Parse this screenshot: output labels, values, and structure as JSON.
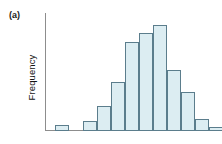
{
  "panel": {
    "label": "(a)"
  },
  "axes": {
    "ylabel": "Frequency",
    "xlabel": "",
    "axis_color": "#8d8d8d"
  },
  "style": {
    "bar_fill": "#dcedf2",
    "bar_border": "#5b7d8c",
    "background": "#ffffff",
    "text_color": "#141414"
  },
  "chart_data": {
    "type": "bar",
    "title": "",
    "subtitle": "",
    "annotations": [
      "(a)"
    ],
    "xlabel": "",
    "ylabel": "Frequency",
    "grid": false,
    "legend": null,
    "xtick_labels": [],
    "ytick_labels": [],
    "ylim": [
      0,
      100
    ],
    "note": "Unimodal, roughly symmetric (slightly right-skewed) histogram; axes unlabelled with no tick values. Values below are relative frequencies read off bar heights as a percentage of the tallest bar.",
    "categories": [
      "1",
      "2",
      "3",
      "4",
      "5",
      "6",
      "7",
      "8",
      "9",
      "10",
      "11",
      "12",
      "13",
      "14"
    ],
    "values": [
      6,
      0,
      9,
      24,
      46,
      84,
      92,
      100,
      58,
      37,
      11,
      4,
      0,
      0
    ],
    "bars": [
      {
        "index": 1,
        "x_left": 10,
        "width": 14,
        "value": 6
      },
      {
        "index": 2,
        "x_left": 38,
        "width": 14,
        "value": 9
      },
      {
        "index": 3,
        "x_left": 52,
        "width": 14,
        "value": 24
      },
      {
        "index": 4,
        "x_left": 66,
        "width": 14,
        "value": 46
      },
      {
        "index": 5,
        "x_left": 80,
        "width": 14,
        "value": 84
      },
      {
        "index": 6,
        "x_left": 94,
        "width": 14,
        "value": 92
      },
      {
        "index": 7,
        "x_left": 108,
        "width": 14,
        "value": 100
      },
      {
        "index": 8,
        "x_left": 122,
        "width": 14,
        "value": 58
      },
      {
        "index": 9,
        "x_left": 136,
        "width": 14,
        "value": 37
      },
      {
        "index": 10,
        "x_left": 150,
        "width": 14,
        "value": 11
      },
      {
        "index": 11,
        "x_left": 164,
        "width": 14,
        "value": 4
      }
    ]
  }
}
